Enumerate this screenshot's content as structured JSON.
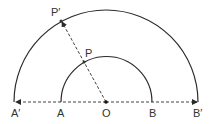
{
  "diagram": {
    "title": "",
    "colors": {
      "stroke": "#2a2a2a",
      "label": "#333333",
      "background": "#ffffff"
    },
    "center": {
      "label": "O",
      "x": 106,
      "y": 102
    },
    "inner_semicircle": {
      "radius": 46,
      "left_label": "A",
      "right_label": "B"
    },
    "outer_semicircle": {
      "radius": 94,
      "left_label": "A′",
      "right_label": "B′"
    },
    "points": [
      {
        "label": "P",
        "x": 84,
        "y": 62,
        "on": "inner_semicircle"
      },
      {
        "label": "P′",
        "x": 61,
        "y": 20,
        "on": "outer_semicircle"
      }
    ],
    "lines": [
      {
        "from": "O",
        "to": "A′",
        "style": "dashed",
        "arrow": "end"
      },
      {
        "from": "O",
        "to": "B′",
        "style": "dashed",
        "arrow": "end"
      },
      {
        "from": "O",
        "to": "P′",
        "style": "dashed",
        "arrow": "end",
        "passes_through": "P"
      }
    ],
    "labels": {
      "A_prime": "A′",
      "A": "A",
      "O": "O",
      "B": "B",
      "B_prime": "B′",
      "P": "P",
      "P_prime": "P′"
    }
  }
}
